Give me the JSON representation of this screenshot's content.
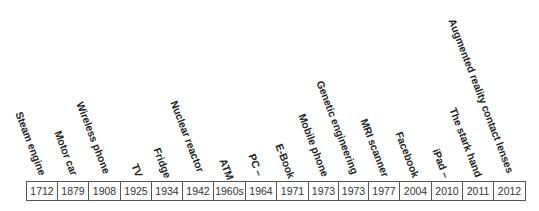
{
  "timeline": {
    "events": [
      {
        "label": "Steam engine",
        "year": "1712"
      },
      {
        "label": "Motor car",
        "year": "1879"
      },
      {
        "label": "Wireless phone",
        "year": "1908"
      },
      {
        "label": "TV",
        "year": "1925"
      },
      {
        "label": "Fridge",
        "year": "1934"
      },
      {
        "label": "Nuclear reactor",
        "year": "1942"
      },
      {
        "label": "ATM",
        "year": "1960s"
      },
      {
        "label": "PC –",
        "year": "1964"
      },
      {
        "label": "E-Book",
        "year": "1971"
      },
      {
        "label": "Mobile phone",
        "year": "1973"
      },
      {
        "label": "Genetic engineering",
        "year": "1973"
      },
      {
        "label": "MRI scanner",
        "year": "1977"
      },
      {
        "label": "Facebook",
        "year": "2004"
      },
      {
        "label": "iPad –",
        "year": "2010"
      },
      {
        "label": "The stark hand",
        "year": "2011"
      },
      {
        "label": "Augmented reality contact lenses",
        "year": "2012"
      }
    ]
  }
}
